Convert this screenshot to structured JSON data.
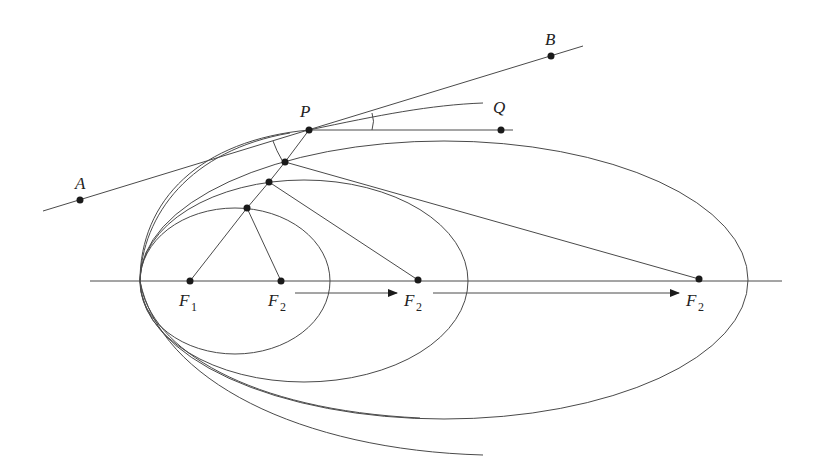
{
  "diagram": {
    "labels": {
      "A": "A",
      "B": "B",
      "P": "P",
      "Q": "Q",
      "F1_main": "F",
      "F1_sub": "1",
      "F2_main": "F",
      "F2_sub": "2"
    },
    "colors": {
      "stroke": "#4a4a4a",
      "dot": "#1a1a1a",
      "background": "#ffffff"
    },
    "points": {
      "A": [
        80,
        200
      ],
      "B": [
        551,
        56
      ],
      "P": [
        309,
        130
      ],
      "Q_dot": [
        501,
        130
      ],
      "F1": [
        190,
        281
      ],
      "F2_small": [
        281,
        281
      ],
      "F2_medium": [
        418,
        280
      ],
      "F2_large": [
        699,
        279
      ],
      "pt_small": [
        247,
        208
      ],
      "pt_medium": [
        269,
        182
      ],
      "pt_large": [
        285,
        162
      ]
    },
    "ellipses": [
      {
        "name": "small",
        "cx": 235,
        "cy": 281,
        "rx": 95,
        "ry": 73
      },
      {
        "name": "medium",
        "cx": 304,
        "cy": 281,
        "rx": 164,
        "ry": 101
      },
      {
        "name": "large",
        "cx": 444,
        "cy": 280,
        "rx": 304,
        "ry": 139
      }
    ],
    "arrows": [
      {
        "from": [
          295,
          293
        ],
        "to": [
          397,
          293
        ]
      },
      {
        "from": [
          433,
          293
        ],
        "to": [
          679,
          293
        ]
      }
    ]
  }
}
